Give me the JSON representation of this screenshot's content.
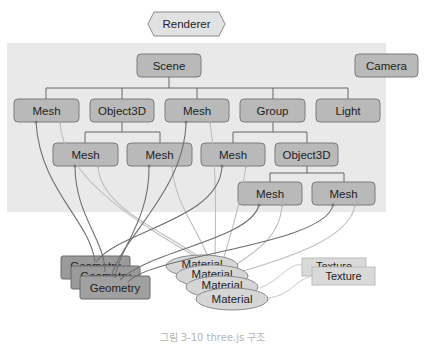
{
  "renderer": {
    "label": "Renderer",
    "x": 148,
    "y": 12,
    "w": 77,
    "h": 24
  },
  "scene_panel": {
    "x": 7,
    "y": 43,
    "w": 379,
    "h": 169
  },
  "camera": {
    "label": "Camera",
    "x": 355,
    "y": 54,
    "w": 63,
    "h": 23
  },
  "scene": {
    "label": "Scene",
    "x": 137,
    "y": 54,
    "w": 64,
    "h": 23
  },
  "row1": [
    {
      "label": "Mesh",
      "x": 14,
      "y": 99,
      "w": 65,
      "h": 23
    },
    {
      "label": "Object3D",
      "x": 90,
      "y": 99,
      "w": 64,
      "h": 23
    },
    {
      "label": "Mesh",
      "x": 165,
      "y": 99,
      "w": 64,
      "h": 23
    },
    {
      "label": "Group",
      "x": 240,
      "y": 99,
      "w": 65,
      "h": 23
    },
    {
      "label": "Light",
      "x": 316,
      "y": 99,
      "w": 64,
      "h": 23
    }
  ],
  "row2": [
    {
      "label": "Mesh",
      "x": 53,
      "y": 143,
      "w": 65,
      "h": 23
    },
    {
      "label": "Mesh",
      "x": 127,
      "y": 143,
      "w": 65,
      "h": 23
    },
    {
      "label": "Mesh",
      "x": 201,
      "y": 143,
      "w": 64,
      "h": 23
    },
    {
      "label": "Object3D",
      "x": 275,
      "y": 143,
      "w": 63,
      "h": 23
    }
  ],
  "row3": [
    {
      "label": "Mesh",
      "x": 238,
      "y": 182,
      "w": 64,
      "h": 23
    },
    {
      "label": "Mesh",
      "x": 312,
      "y": 182,
      "w": 63,
      "h": 23
    }
  ],
  "geometry_stack": [
    {
      "label": "Geometry",
      "x": 61,
      "y": 256,
      "w": 69,
      "h": 23
    },
    {
      "label": "Geometry",
      "x": 71,
      "y": 266,
      "w": 69,
      "h": 23
    },
    {
      "label": "Geometry",
      "x": 80,
      "y": 276,
      "w": 70,
      "h": 23
    }
  ],
  "material_stack": [
    {
      "label": "Material",
      "cx": 202,
      "cy": 266,
      "rx": 36,
      "ry": 11
    },
    {
      "label": "Material",
      "cx": 212,
      "cy": 276,
      "rx": 36,
      "ry": 11
    },
    {
      "label": "Material",
      "cx": 222,
      "cy": 287,
      "rx": 36,
      "ry": 11
    },
    {
      "label": "Material",
      "cx": 232,
      "cy": 299,
      "rx": 36,
      "ry": 11
    }
  ],
  "texture_stack": [
    {
      "label": "Texture",
      "x": 302,
      "y": 258,
      "w": 64,
      "h": 18
    },
    {
      "label": "Texture",
      "x": 312,
      "y": 267,
      "w": 63,
      "h": 18
    }
  ],
  "caption": "그림 3-10 three.js 구조",
  "colors": {
    "panel": "#e9e9e9",
    "node": "#b9b9b9",
    "geometry": "#9a9a9a",
    "material": "#d6d6d6",
    "texture": "#d9d9d9",
    "geometry_edge": "#6f6f6f",
    "material_edge": "#bdbdbd"
  }
}
